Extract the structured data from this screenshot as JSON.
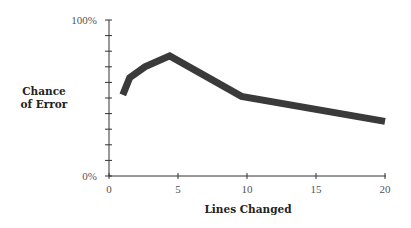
{
  "chart_data": {
    "type": "line",
    "title": "",
    "xlabel": "Lines Changed",
    "ylabel": [
      "Chance",
      "of Error"
    ],
    "xlim": [
      0,
      20
    ],
    "ylim": [
      0,
      100
    ],
    "x_ticks": [
      "0",
      "5",
      "10",
      "15",
      "20"
    ],
    "y_ticks": [
      "0%",
      "100%"
    ],
    "y_minor_ticks_every": 10,
    "grid": false,
    "legend": null,
    "series": [
      {
        "name": "Chance of Error",
        "color": "#3a3a3a",
        "x": [
          1.0,
          1.5,
          2.6,
          4.4,
          9.6,
          20
        ],
        "y": [
          52,
          63,
          70,
          77,
          51,
          35
        ]
      }
    ]
  }
}
